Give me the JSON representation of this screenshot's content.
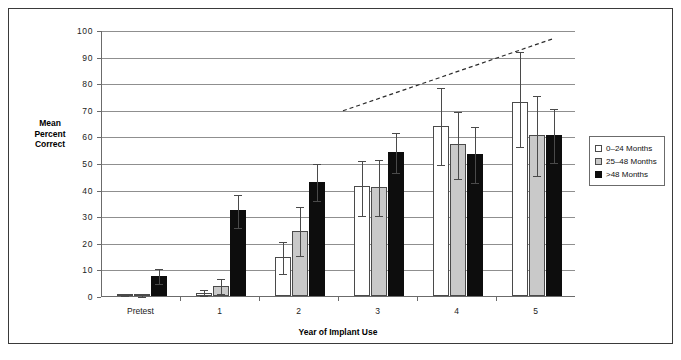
{
  "chart_data": {
    "type": "bar",
    "title": "",
    "xlabel": "Year of Implant Use",
    "ylabel": "Mean Percent Correct",
    "ylim": [
      0,
      100
    ],
    "ytick_step": 10,
    "yticks": [
      0,
      10,
      20,
      30,
      40,
      50,
      60,
      70,
      80,
      90,
      100
    ],
    "grid": true,
    "legend_position": "right",
    "categories": [
      "Pretest",
      "1",
      "2",
      "3",
      "4",
      "5"
    ],
    "series": [
      {
        "name": "0–24 Months",
        "color": "#ffffff",
        "values": [
          0.2,
          1.3,
          14.7,
          41.5,
          64.0,
          73.0
        ],
        "err_low": [
          0.2,
          0.5,
          8.8,
          30.5,
          49.5,
          56.5
        ],
        "err_high": [
          0.8,
          2.6,
          20.5,
          51.0,
          78.5,
          92.0
        ]
      },
      {
        "name": "25–48 Months",
        "color": "#c9c9c9",
        "values": [
          0.5,
          3.8,
          24.6,
          41.0,
          57.0,
          60.5
        ],
        "err_low": [
          0.1,
          1.0,
          15.4,
          30.5,
          44.5,
          45.5
        ],
        "err_high": [
          1.0,
          6.6,
          33.9,
          51.5,
          69.5,
          75.5
        ]
      },
      {
        "name": ">48 Months",
        "color": "#0d0d0d",
        "values": [
          7.5,
          32.2,
          43.0,
          54.0,
          53.5,
          60.5
        ],
        "err_low": [
          5.0,
          26.0,
          36.0,
          46.5,
          43.0,
          50.5
        ],
        "err_high": [
          10.5,
          38.5,
          50.0,
          61.5,
          64.0,
          70.5
        ]
      }
    ],
    "annotations": [
      {
        "name": "trend-line",
        "style": "dashed",
        "x_start_value": 2.55,
        "y_start_value": 70,
        "x_end_value": 5.2,
        "y_end_value": 97
      }
    ]
  },
  "legend": {
    "items": [
      {
        "label": "0–24 Months"
      },
      {
        "label": "25–48 Months"
      },
      {
        "label": ">48 Months"
      }
    ]
  },
  "axis": {
    "y_title_lines": [
      "Mean",
      "Percent",
      "Correct"
    ],
    "x_title": "Year of Implant Use"
  }
}
